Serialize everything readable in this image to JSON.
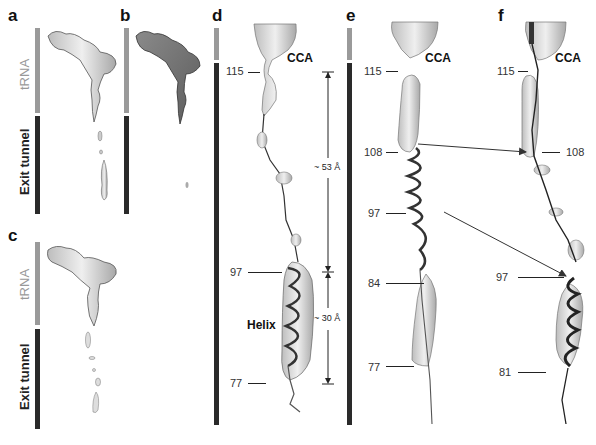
{
  "figure": {
    "panels": {
      "a": {
        "label": "a",
        "bar_top": "tRNA",
        "bar_bottom": "Exit tunnel"
      },
      "b": {
        "label": "b"
      },
      "c": {
        "label": "c",
        "bar_top": "tRNA",
        "bar_bottom": "Exit tunnel"
      },
      "d": {
        "label": "d",
        "cca": "CCA",
        "residues": [
          "115",
          "97",
          "77"
        ],
        "helix_label": "Helix",
        "measurements": [
          "~ 53 Å",
          "~ 30 Å"
        ]
      },
      "e": {
        "label": "e",
        "cca": "CCA",
        "residues": [
          "115",
          "108",
          "97",
          "84",
          "77"
        ]
      },
      "f": {
        "label": "f",
        "cca": "CCA",
        "residues": [
          "115",
          "108",
          "97",
          "81"
        ]
      }
    },
    "colors": {
      "trna_bar": "#9a9a9a",
      "tunnel_bar": "#2a2a2a",
      "density": "#d8d8d8",
      "chain": "#222222"
    }
  }
}
